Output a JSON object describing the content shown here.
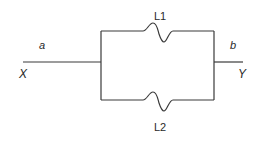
{
  "diagram": {
    "type": "parallel-circuit",
    "stroke_color": "#3a3a3a",
    "labels": {
      "input_node": "X",
      "output_node": "Y",
      "input_segment": "a",
      "output_segment": "b",
      "upper_branch": "L1",
      "lower_branch": "L2"
    },
    "branches": [
      {
        "name": "L1",
        "position": "upper",
        "element": "wave-element"
      },
      {
        "name": "L2",
        "position": "lower",
        "element": "wave-element"
      }
    ]
  }
}
